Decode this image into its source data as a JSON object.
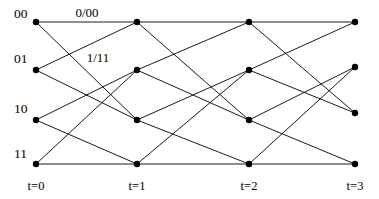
{
  "figure": {
    "kind": "trellis-diagram",
    "width": 379,
    "height": 199,
    "background_color": "#ffffff",
    "line_color": "#000000",
    "node_color": "#000000",
    "node_radius": 3.2,
    "line_width": 0.9
  },
  "state_labels": [
    {
      "text": "00",
      "x": 14,
      "y": 18
    },
    {
      "text": "01",
      "x": 14,
      "y": 63
    },
    {
      "text": "10",
      "x": 14,
      "y": 113
    },
    {
      "text": "11",
      "x": 14,
      "y": 158
    }
  ],
  "time_labels": [
    {
      "text": "t=0",
      "x": 36,
      "y": 190
    },
    {
      "text": "t=1",
      "x": 137,
      "y": 190
    },
    {
      "text": "t=2",
      "x": 249,
      "y": 190
    },
    {
      "text": "t=3",
      "x": 355,
      "y": 190
    }
  ],
  "edge_labels": [
    {
      "text": "0/00",
      "x": 87,
      "y": 17
    },
    {
      "text": "1/11",
      "x": 98,
      "y": 62
    }
  ],
  "columns": [
    {
      "time": "t=0",
      "x": 36,
      "nodes": [
        {
          "state": "00",
          "x": 36,
          "y": 22
        },
        {
          "state": "01",
          "x": 36,
          "y": 70
        },
        {
          "state": "10",
          "x": 36,
          "y": 120
        },
        {
          "state": "11",
          "x": 36,
          "y": 164
        }
      ]
    },
    {
      "time": "t=1",
      "x": 137,
      "nodes": [
        {
          "state": "00",
          "x": 137,
          "y": 22
        },
        {
          "state": "01",
          "x": 137,
          "y": 70
        },
        {
          "state": "10",
          "x": 137,
          "y": 120
        },
        {
          "state": "11",
          "x": 137,
          "y": 164
        }
      ]
    },
    {
      "time": "t=2",
      "x": 249,
      "nodes": [
        {
          "state": "00",
          "x": 249,
          "y": 22
        },
        {
          "state": "01",
          "x": 249,
          "y": 70
        },
        {
          "state": "10",
          "x": 249,
          "y": 120
        },
        {
          "state": "11",
          "x": 249,
          "y": 164
        }
      ]
    },
    {
      "time": "t=3",
      "x": 355,
      "nodes": [
        {
          "state": "00",
          "x": 355,
          "y": 22
        },
        {
          "state": "01",
          "x": 355,
          "y": 67
        },
        {
          "state": "10",
          "x": 355,
          "y": 113
        },
        {
          "state": "11",
          "x": 355,
          "y": 164
        }
      ]
    }
  ],
  "edges": [
    {
      "from_time": 0,
      "from_state": "00",
      "to_time": 1,
      "to_state": "00",
      "x1": 36,
      "y1": 22,
      "x2": 137,
      "y2": 22
    },
    {
      "from_time": 0,
      "from_state": "00",
      "to_time": 1,
      "to_state": "10",
      "x1": 36,
      "y1": 22,
      "x2": 137,
      "y2": 120
    },
    {
      "from_time": 0,
      "from_state": "01",
      "to_time": 1,
      "to_state": "00",
      "x1": 36,
      "y1": 70,
      "x2": 137,
      "y2": 22
    },
    {
      "from_time": 0,
      "from_state": "01",
      "to_time": 1,
      "to_state": "10",
      "x1": 36,
      "y1": 70,
      "x2": 137,
      "y2": 120
    },
    {
      "from_time": 0,
      "from_state": "10",
      "to_time": 1,
      "to_state": "01",
      "x1": 36,
      "y1": 120,
      "x2": 137,
      "y2": 70
    },
    {
      "from_time": 0,
      "from_state": "10",
      "to_time": 1,
      "to_state": "11",
      "x1": 36,
      "y1": 120,
      "x2": 137,
      "y2": 164
    },
    {
      "from_time": 0,
      "from_state": "11",
      "to_time": 1,
      "to_state": "01",
      "x1": 36,
      "y1": 164,
      "x2": 137,
      "y2": 70
    },
    {
      "from_time": 0,
      "from_state": "11",
      "to_time": 1,
      "to_state": "11",
      "x1": 36,
      "y1": 164,
      "x2": 137,
      "y2": 164
    },
    {
      "from_time": 1,
      "from_state": "00",
      "to_time": 2,
      "to_state": "00",
      "x1": 137,
      "y1": 22,
      "x2": 249,
      "y2": 22
    },
    {
      "from_time": 1,
      "from_state": "00",
      "to_time": 2,
      "to_state": "10",
      "x1": 137,
      "y1": 22,
      "x2": 249,
      "y2": 120
    },
    {
      "from_time": 1,
      "from_state": "01",
      "to_time": 2,
      "to_state": "00",
      "x1": 137,
      "y1": 70,
      "x2": 249,
      "y2": 22
    },
    {
      "from_time": 1,
      "from_state": "01",
      "to_time": 2,
      "to_state": "10",
      "x1": 137,
      "y1": 70,
      "x2": 249,
      "y2": 120
    },
    {
      "from_time": 1,
      "from_state": "10",
      "to_time": 2,
      "to_state": "01",
      "x1": 137,
      "y1": 120,
      "x2": 249,
      "y2": 70
    },
    {
      "from_time": 1,
      "from_state": "10",
      "to_time": 2,
      "to_state": "11",
      "x1": 137,
      "y1": 120,
      "x2": 249,
      "y2": 164
    },
    {
      "from_time": 1,
      "from_state": "11",
      "to_time": 2,
      "to_state": "01",
      "x1": 137,
      "y1": 164,
      "x2": 249,
      "y2": 70
    },
    {
      "from_time": 1,
      "from_state": "11",
      "to_time": 2,
      "to_state": "11",
      "x1": 137,
      "y1": 164,
      "x2": 249,
      "y2": 164
    },
    {
      "from_time": 2,
      "from_state": "00",
      "to_time": 3,
      "to_state": "00",
      "x1": 249,
      "y1": 22,
      "x2": 355,
      "y2": 22
    },
    {
      "from_time": 2,
      "from_state": "00",
      "to_time": 3,
      "to_state": "10",
      "x1": 249,
      "y1": 22,
      "x2": 355,
      "y2": 113
    },
    {
      "from_time": 2,
      "from_state": "01",
      "to_time": 3,
      "to_state": "00",
      "x1": 249,
      "y1": 70,
      "x2": 355,
      "y2": 22
    },
    {
      "from_time": 2,
      "from_state": "01",
      "to_time": 3,
      "to_state": "10",
      "x1": 249,
      "y1": 70,
      "x2": 355,
      "y2": 113
    },
    {
      "from_time": 2,
      "from_state": "10",
      "to_time": 3,
      "to_state": "01",
      "x1": 249,
      "y1": 120,
      "x2": 355,
      "y2": 67
    },
    {
      "from_time": 2,
      "from_state": "10",
      "to_time": 3,
      "to_state": "11",
      "x1": 249,
      "y1": 120,
      "x2": 355,
      "y2": 164
    },
    {
      "from_time": 2,
      "from_state": "11",
      "to_time": 3,
      "to_state": "01",
      "x1": 249,
      "y1": 164,
      "x2": 355,
      "y2": 67
    },
    {
      "from_time": 2,
      "from_state": "11",
      "to_time": 3,
      "to_state": "11",
      "x1": 249,
      "y1": 164,
      "x2": 355,
      "y2": 164
    }
  ]
}
